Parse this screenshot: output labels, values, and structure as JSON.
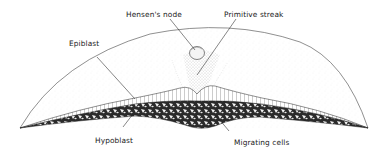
{
  "diagram": {
    "labels": {
      "hensens_node": "Hensen's node",
      "primitive_streak": "Primitive streak",
      "epiblast": "Epiblast",
      "hypoblast": "Hypoblast",
      "migrating_cells": "Migrating cells"
    },
    "colors": {
      "ink": "#1a1a1a",
      "stipple": "#555555",
      "background": "#ffffff"
    }
  }
}
